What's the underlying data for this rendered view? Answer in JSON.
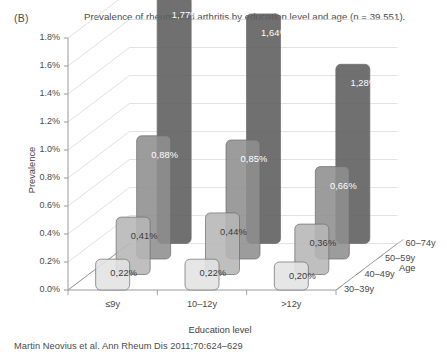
{
  "panel": {
    "label": "(B)"
  },
  "figure": {
    "title": "Prevalence of rheumatoid arthritis by education level and age (n = 39 551).",
    "citation": "Martin Neovius et al. Ann Rheum Dis 2011;70:624–629"
  },
  "axes": {
    "y_title": "Prevalence",
    "x_title": "Education level",
    "z_title": "Age",
    "y_ticks": [
      "0.0%",
      "0.2%",
      "0.4%",
      "0.6%",
      "0.8%",
      "1.0%",
      "1.2%",
      "1.4%",
      "1.6%",
      "1.8%"
    ],
    "x_ticks": [
      "≤9y",
      "10–12y",
      ">12y"
    ],
    "z_ticks": [
      "30–39y",
      "40–49y",
      "50–59y",
      "60–74y"
    ]
  },
  "chart_data": {
    "type": "bar",
    "title": "Prevalence of rheumatoid arthritis by education level and age (n = 39 551).",
    "xlabel": "Education level",
    "ylabel": "Prevalence",
    "zlabel": "Age",
    "categories": [
      "≤9y",
      "10–12y",
      ">12y"
    ],
    "ylim": [
      0.0,
      1.8
    ],
    "ytick_step": 0.2,
    "grid": true,
    "legend_position": "right-depth-axis",
    "projection": "3d",
    "series": [
      {
        "name": "30–39y",
        "color": "#e2e2e2",
        "values": [
          0.22,
          0.22,
          0.2
        ],
        "labels": [
          "0,22%",
          "0,22%",
          "0,20%"
        ]
      },
      {
        "name": "40–49y",
        "color": "#b6b6b6",
        "values": [
          0.41,
          0.44,
          0.36
        ],
        "labels": [
          "0,41%",
          "0,44%",
          "0,36%"
        ]
      },
      {
        "name": "50–59y",
        "color": "#8e8e8e",
        "values": [
          0.88,
          0.85,
          0.66
        ],
        "labels": [
          "0,88%",
          "0,85%",
          "0,66%"
        ]
      },
      {
        "name": "60–74y",
        "color": "#5c5c5c",
        "values": [
          1.77,
          1.64,
          1.28
        ],
        "labels": [
          "1,77%",
          "1,64%",
          "1,28%"
        ]
      }
    ]
  }
}
